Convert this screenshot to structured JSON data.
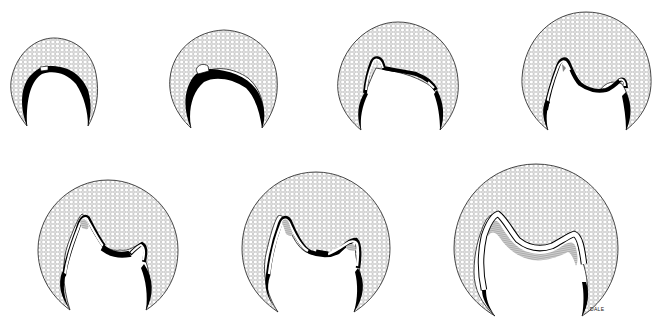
{
  "figure": {
    "description": "Seven sequential stages of tooth germ development (bud/cap to bell stage), each shown as a hexagon-stippled dental organ enclosing a developing crown outline",
    "signature": "DALE",
    "colors": {
      "background": "#ffffff",
      "outline": "#1a1a1a",
      "stipple_fill": "#e6e6e6",
      "stipple_line": "#6e6e6e",
      "dentin_band": "#000000",
      "enamel_band": "#ffffff",
      "striated_layer": "#8a8a8a"
    },
    "stages": [
      {
        "index": 1,
        "label": "stage-1",
        "cx": 53,
        "cy": 82,
        "r": 44
      },
      {
        "index": 2,
        "label": "stage-2",
        "cx": 223,
        "cy": 80,
        "r": 54
      },
      {
        "index": 3,
        "label": "stage-3",
        "cx": 398,
        "cy": 78,
        "r": 60
      },
      {
        "index": 4,
        "label": "stage-4",
        "cx": 586,
        "cy": 75,
        "r": 64
      },
      {
        "index": 5,
        "label": "stage-5",
        "cx": 108,
        "cy": 248,
        "r": 70
      },
      {
        "index": 6,
        "label": "stage-6",
        "cx": 315,
        "cy": 245,
        "r": 75
      },
      {
        "index": 7,
        "label": "stage-7",
        "cx": 535,
        "cy": 243,
        "r": 82
      }
    ]
  }
}
